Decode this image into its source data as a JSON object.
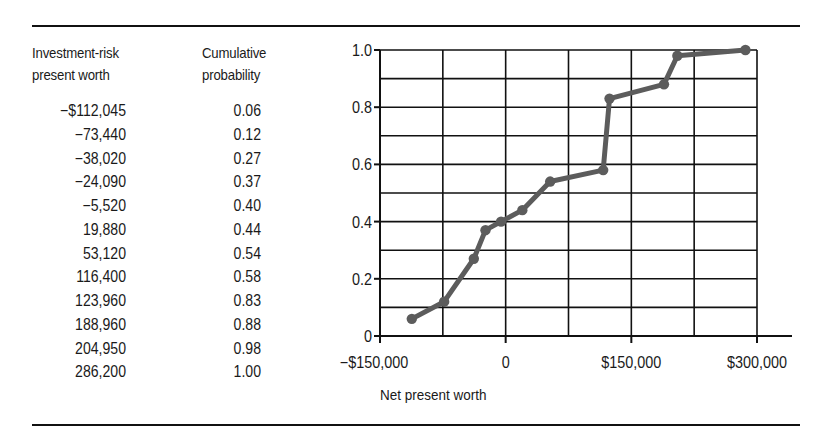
{
  "table": {
    "headers": {
      "value_line1": "Investment-risk",
      "value_line2": "present worth",
      "prob_line1": "Cumulative",
      "prob_line2": "probability"
    },
    "rows": [
      {
        "value": "−$112,045",
        "prob": "0.06"
      },
      {
        "value": "−73,440",
        "prob": "0.12"
      },
      {
        "value": "−38,020",
        "prob": "0.27"
      },
      {
        "value": "−24,090",
        "prob": "0.37"
      },
      {
        "value": "−5,520",
        "prob": "0.40"
      },
      {
        "value": "19,880",
        "prob": "0.44"
      },
      {
        "value": "53,120",
        "prob": "0.54"
      },
      {
        "value": "116,400",
        "prob": "0.58"
      },
      {
        "value": "123,960",
        "prob": "0.83"
      },
      {
        "value": "188,960",
        "prob": "0.88"
      },
      {
        "value": "204,950",
        "prob": "0.98"
      },
      {
        "value": "286,200",
        "prob": "1.00"
      }
    ]
  },
  "chart_data": {
    "type": "line",
    "title": "",
    "xlabel": "Net present worth",
    "ylabel": "",
    "x": [
      -112045,
      -73440,
      -38020,
      -24090,
      -5520,
      19880,
      53120,
      116400,
      123960,
      188960,
      204950,
      286200
    ],
    "y": [
      0.06,
      0.12,
      0.27,
      0.37,
      0.4,
      0.44,
      0.54,
      0.58,
      0.83,
      0.88,
      0.98,
      1.0
    ],
    "series": [
      {
        "name": "Cumulative probability",
        "x": [
          -112045,
          -73440,
          -38020,
          -24090,
          -5520,
          19880,
          53120,
          116400,
          123960,
          188960,
          204950,
          286200
        ],
        "values": [
          0.06,
          0.12,
          0.27,
          0.37,
          0.4,
          0.44,
          0.54,
          0.58,
          0.83,
          0.88,
          0.98,
          1.0
        ]
      }
    ],
    "xlim": [
      -150000,
      300000
    ],
    "ylim": [
      0,
      1.0
    ],
    "x_gridlines": [
      -150000,
      -75000,
      0,
      75000,
      150000,
      225000,
      300000
    ],
    "y_gridlines": [
      0,
      0.1,
      0.2,
      0.3,
      0.4,
      0.5,
      0.6,
      0.7,
      0.8,
      0.9,
      1.0
    ],
    "x_ticks": [
      {
        "value": -150000,
        "label": "−$150,000"
      },
      {
        "value": 0,
        "label": "0"
      },
      {
        "value": 150000,
        "label": "$150,000"
      },
      {
        "value": 300000,
        "label": "$300,000"
      }
    ],
    "y_ticks": [
      {
        "value": 0,
        "label": "0"
      },
      {
        "value": 0.2,
        "label": "0.2"
      },
      {
        "value": 0.4,
        "label": "0.4"
      },
      {
        "value": 0.6,
        "label": "0.6"
      },
      {
        "value": 0.8,
        "label": "0.8"
      },
      {
        "value": 1.0,
        "label": "1.0"
      }
    ],
    "grid": true,
    "legend": "none",
    "colors": {
      "line": "#5c5c5c",
      "grid": "#111111",
      "text": "#1a1a1a"
    }
  }
}
